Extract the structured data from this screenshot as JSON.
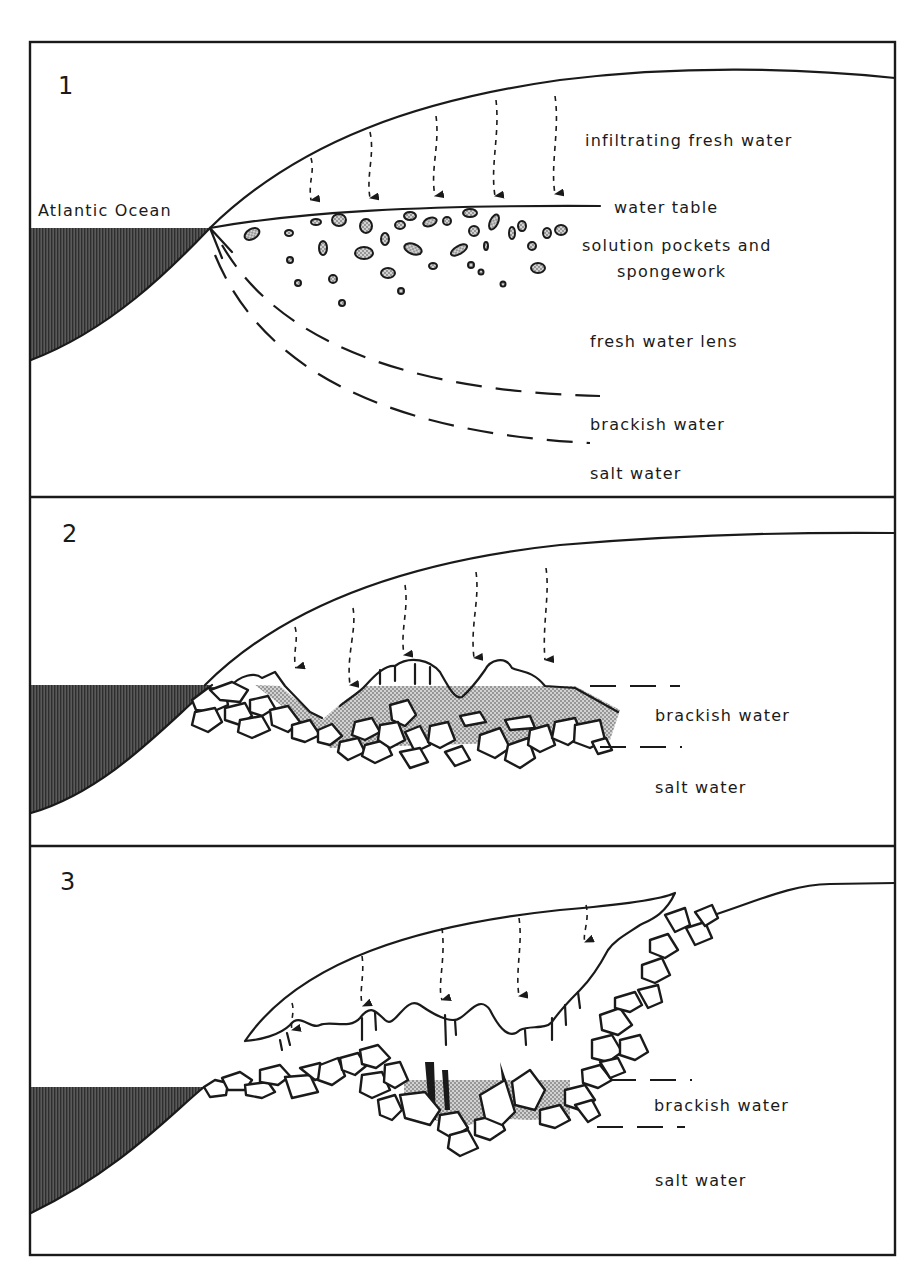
{
  "figure": {
    "colors": {
      "ink": "#1a1a1a",
      "ocean_fill": "#4a4a4a",
      "stipple": "#9a9a9a",
      "background": "#ffffff"
    }
  },
  "panels": [
    {
      "number": "1",
      "labels": {
        "ocean": "Atlantic Ocean",
        "infiltration": "infiltrating fresh water",
        "water_table": "water table",
        "pockets_line1": "solution pockets and",
        "pockets_line2": "spongework",
        "lens": "fresh water lens",
        "brackish": "brackish water",
        "salt": "salt water"
      }
    },
    {
      "number": "2",
      "labels": {
        "brackish": "brackish water",
        "salt": "salt water"
      }
    },
    {
      "number": "3",
      "labels": {
        "brackish": "brackish water",
        "salt": "salt water"
      }
    }
  ]
}
